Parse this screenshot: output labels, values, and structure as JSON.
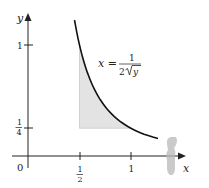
{
  "chart_data": {
    "type": "area",
    "title": "",
    "xlabel": "x",
    "ylabel": "y",
    "origin_label": "0",
    "x_ticks": [
      {
        "value": 0.5,
        "label_num": "1",
        "label_den": "2"
      },
      {
        "value": 1,
        "label": "1"
      }
    ],
    "y_ticks": [
      {
        "value": 0.25,
        "label_num": "1",
        "label_den": "4"
      },
      {
        "value": 1,
        "label": "1"
      }
    ],
    "curve": {
      "equation_lhs": "x =",
      "equation_num": "1",
      "equation_den_coef": "2",
      "equation_den_var": "y",
      "description": "x = 1/(2√y)",
      "y_range": [
        0.157,
        1.225
      ]
    },
    "shaded_region": {
      "description": "Region bounded by x = 1/2, y = 1/4 and the curve x = 1/(2√y)",
      "x_range": [
        0.5,
        1
      ],
      "y_range": [
        0.25,
        1
      ],
      "color": "#e3e3e3"
    },
    "xlim": [
      0,
      1.45
    ],
    "ylim": [
      0,
      1.3
    ]
  },
  "colors": {
    "axis": "#222222",
    "curve": "#111111",
    "shade": "#e3e3e3",
    "artifact": "#b8b8b8"
  }
}
